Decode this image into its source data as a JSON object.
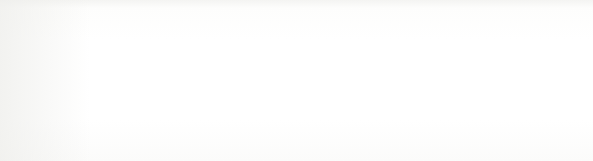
{
  "figure": {
    "label": "Figure 9-4",
    "caption": "Adding an item to a nonempty queue",
    "background_color": "#fcfcfb",
    "ink_color": "#1a1a1a",
    "highlight_fill": "#a6a6a6"
  },
  "code": {
    "lines": [
      "1. p^.next := Q^.next;",
      "2. Q^.next := p;",
      "3. Q := p;"
    ]
  },
  "linked_list": {
    "nodes": [
      {
        "id": "node-2",
        "value": "2",
        "highlighted": false
      },
      {
        "id": "node-4",
        "value": "4",
        "highlighted": false
      },
      {
        "id": "node-1",
        "value": "1",
        "highlighted": false
      },
      {
        "id": "node-7",
        "value": "7",
        "highlighted": false
      },
      {
        "id": "node-3",
        "value": "3",
        "highlighted": true
      }
    ]
  },
  "pointers": [
    {
      "id": "pointer-q",
      "name": "Q",
      "label": "Q",
      "highlighted": false
    },
    {
      "id": "pointer-p",
      "name": "p",
      "label": "p (points to new node)",
      "highlighted": true
    }
  ],
  "step_markers": [
    {
      "id": "step-1",
      "text": "1",
      "meaning": "new node next points to head"
    },
    {
      "id": "step-2",
      "text": "2",
      "meaning": "old tail next points to new node"
    },
    {
      "id": "step-3",
      "text": "3",
      "meaning": "Q moves to new node"
    }
  ]
}
